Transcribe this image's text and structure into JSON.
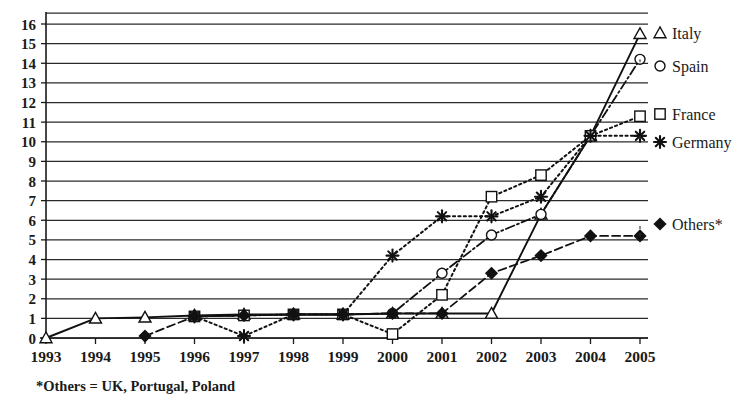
{
  "chart_data": {
    "type": "line",
    "title": "",
    "subtitle": "",
    "xlabel": "",
    "ylabel": "",
    "x": [
      1993,
      1994,
      1995,
      1996,
      1997,
      1998,
      1999,
      2000,
      2001,
      2002,
      2003,
      2004,
      2005
    ],
    "categories": [
      "1993",
      "1994",
      "1995",
      "1996",
      "1997",
      "1998",
      "1999",
      "2000",
      "2001",
      "2002",
      "2003",
      "2004",
      "2005"
    ],
    "xlim": [
      1993,
      2005
    ],
    "ylim": [
      0,
      16
    ],
    "ytick_labels": [
      "0",
      "1",
      "2",
      "3",
      "4",
      "5",
      "6",
      "7",
      "8",
      "9",
      "10",
      "11",
      "12",
      "13",
      "14",
      "15",
      "16"
    ],
    "ytick_values": [
      0,
      1,
      2,
      3,
      4,
      5,
      6,
      7,
      8,
      9,
      10,
      11,
      12,
      13,
      14,
      15,
      16
    ],
    "grid": "horizontal",
    "legend_position": "right-inline-labels",
    "series": [
      {
        "name": "Italy",
        "marker": "triangle-open",
        "linestyle": "solid",
        "label_value": "15.5",
        "values": [
          0,
          1.0,
          1.05,
          1.15,
          1.2,
          1.2,
          1.2,
          1.25,
          1.25,
          1.25,
          6.3,
          10.3,
          15.5
        ]
      },
      {
        "name": "Spain",
        "marker": "circle-open",
        "linestyle": "dash-dot",
        "label_value": "14.2",
        "values": [
          null,
          null,
          null,
          1.1,
          1.15,
          1.2,
          1.2,
          1.25,
          3.3,
          5.25,
          6.3,
          10.3,
          14.2
        ]
      },
      {
        "name": "France",
        "marker": "square-open",
        "linestyle": "dotted",
        "label_value": "11.3",
        "values": [
          null,
          null,
          null,
          1.1,
          1.15,
          1.2,
          1.2,
          0.2,
          2.2,
          7.2,
          8.3,
          10.3,
          11.3
        ]
      },
      {
        "name": "Germany",
        "marker": "asterisk",
        "linestyle": "dotted",
        "label_value": "10.3",
        "values": [
          null,
          null,
          null,
          1.1,
          0.1,
          1.2,
          1.2,
          4.2,
          6.2,
          6.2,
          7.2,
          10.3,
          10.3
        ]
      },
      {
        "name": "Others*",
        "marker": "diamond",
        "linestyle": "dashed",
        "label_value": "5.2",
        "values": [
          null,
          null,
          0.1,
          1.1,
          1.15,
          1.2,
          1.2,
          1.25,
          1.25,
          3.3,
          4.2,
          5.2,
          5.2
        ]
      }
    ],
    "annotations": {
      "footnote": "*Others = UK, Portugal, Poland"
    }
  },
  "axes": {
    "y_ticks": [
      "16",
      "15",
      "14",
      "13",
      "12",
      "11",
      "10",
      "9",
      "8",
      "7",
      "6",
      "5",
      "4",
      "3",
      "2",
      "1",
      "0"
    ],
    "x_ticks": [
      "1993",
      "1994",
      "1995",
      "1996",
      "1997",
      "1998",
      "1999",
      "2000",
      "2001",
      "2002",
      "2003",
      "2004",
      "2005"
    ]
  },
  "legend": {
    "items": [
      {
        "label": "Italy",
        "marker": "triangle-open"
      },
      {
        "label": "Spain",
        "marker": "circle-open"
      },
      {
        "label": "France",
        "marker": "square-open"
      },
      {
        "label": "Germany",
        "marker": "asterisk"
      },
      {
        "label": "Others*",
        "marker": "diamond"
      }
    ]
  },
  "footnote": {
    "text": "*Others = UK, Portugal, Poland"
  }
}
